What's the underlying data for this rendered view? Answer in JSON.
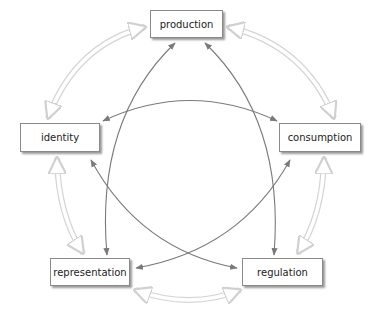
{
  "diagram": {
    "nodes": [
      {
        "id": "production",
        "label": "production"
      },
      {
        "id": "identity",
        "label": "identity"
      },
      {
        "id": "consumption",
        "label": "consumption"
      },
      {
        "id": "representation",
        "label": "representation"
      },
      {
        "id": "regulation",
        "label": "regulation"
      }
    ],
    "outer_links": [
      {
        "from": "production",
        "to": "identity",
        "style": "hollow double-headed arrow"
      },
      {
        "from": "production",
        "to": "consumption",
        "style": "hollow double-headed arrow"
      },
      {
        "from": "identity",
        "to": "representation",
        "style": "hollow double-headed arrow"
      },
      {
        "from": "consumption",
        "to": "regulation",
        "style": "hollow double-headed arrow"
      },
      {
        "from": "representation",
        "to": "regulation",
        "style": "hollow double-headed arrow"
      }
    ],
    "inner_links": [
      {
        "from": "production",
        "to": "representation",
        "style": "solid double-headed arrow"
      },
      {
        "from": "production",
        "to": "regulation",
        "style": "solid double-headed arrow"
      },
      {
        "from": "identity",
        "to": "consumption",
        "style": "solid double-headed arrow"
      },
      {
        "from": "identity",
        "to": "regulation",
        "style": "solid double-headed arrow"
      },
      {
        "from": "consumption",
        "to": "representation",
        "style": "solid double-headed arrow"
      }
    ],
    "colors": {
      "inner_arrow": "#7a7a7a",
      "outer_arrow": "#d4d4d4",
      "box_border": "#8a8a8a"
    }
  }
}
